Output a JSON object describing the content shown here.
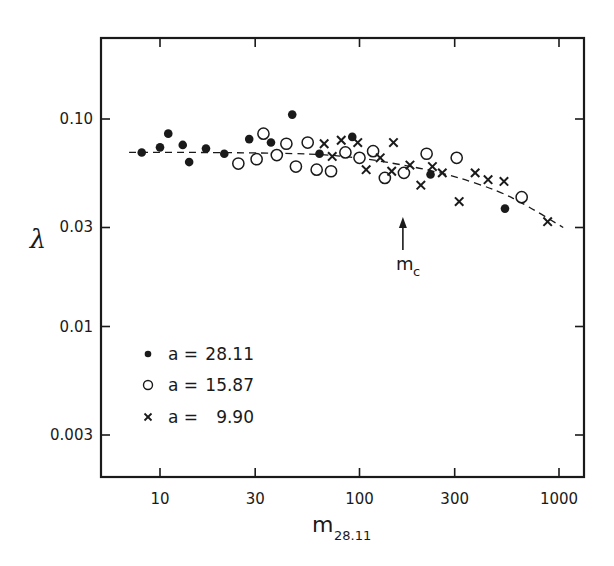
{
  "chart_data": {
    "type": "scatter",
    "title": "",
    "xlabel": "m",
    "xlabel_subscript": "28.11",
    "ylabel": "λ",
    "xscale": "log",
    "yscale": "log",
    "xlim": [
      6,
      1300
    ],
    "ylim": [
      0.0022,
      0.27
    ],
    "grid": false,
    "legend_position": "lower left (inside plot)",
    "x_ticks": [
      10,
      30,
      100,
      300,
      1000
    ],
    "x_tick_labels": [
      "10",
      "30",
      "100",
      "300",
      "1000"
    ],
    "y_ticks": [
      0.1,
      0.03,
      0.01,
      0.003
    ],
    "y_tick_labels": [
      "0.10",
      "0.03",
      "0.01",
      "0.003"
    ],
    "series": [
      {
        "name": "a = 28.11",
        "marker": "filled-circle",
        "legend_symbol": "•",
        "legend_a": "a =",
        "legend_value": "28.11",
        "points": [
          [
            8.1,
            0.069
          ],
          [
            10,
            0.073
          ],
          [
            11,
            0.085
          ],
          [
            13,
            0.075
          ],
          [
            14,
            0.062
          ],
          [
            17,
            0.072
          ],
          [
            21,
            0.068
          ],
          [
            28,
            0.08
          ],
          [
            36,
            0.077
          ],
          [
            46,
            0.105
          ],
          [
            63,
            0.068
          ],
          [
            92,
            0.082
          ],
          [
            227,
            0.054
          ],
          [
            536,
            0.037
          ]
        ]
      },
      {
        "name": "a = 15.87",
        "marker": "open-circle",
        "legend_symbol": "○",
        "legend_a": "a =",
        "legend_value": "15.87",
        "points": [
          [
            24.7,
            0.061
          ],
          [
            30.5,
            0.064
          ],
          [
            33,
            0.085
          ],
          [
            38.5,
            0.067
          ],
          [
            43,
            0.076
          ],
          [
            48,
            0.059
          ],
          [
            55,
            0.077
          ],
          [
            61,
            0.057
          ],
          [
            72,
            0.056
          ],
          [
            85,
            0.069
          ],
          [
            100,
            0.065
          ],
          [
            117,
            0.07
          ],
          [
            134,
            0.052
          ],
          [
            167,
            0.055
          ],
          [
            217,
            0.068
          ],
          [
            307,
            0.065
          ],
          [
            650,
            0.042
          ]
        ]
      },
      {
        "name": "a = 9.90",
        "marker": "cross",
        "legend_symbol": "×",
        "legend_a": "a =",
        "legend_value": "9.90",
        "points": [
          [
            66.5,
            0.076
          ],
          [
            73,
            0.066
          ],
          [
            81,
            0.079
          ],
          [
            98,
            0.077
          ],
          [
            108,
            0.057
          ],
          [
            127,
            0.065
          ],
          [
            145,
            0.056
          ],
          [
            148,
            0.077
          ],
          [
            179,
            0.06
          ],
          [
            203,
            0.048
          ],
          [
            232,
            0.059
          ],
          [
            260,
            0.055
          ],
          [
            316,
            0.04
          ],
          [
            380,
            0.055
          ],
          [
            441,
            0.051
          ],
          [
            530,
            0.05
          ],
          [
            877,
            0.032
          ]
        ]
      }
    ],
    "fit_curve": {
      "style": "dashed",
      "points": [
        [
          7,
          0.069
        ],
        [
          20,
          0.069
        ],
        [
          60,
          0.068
        ],
        [
          100,
          0.065
        ],
        [
          150,
          0.061
        ],
        [
          200,
          0.058
        ],
        [
          300,
          0.053
        ],
        [
          500,
          0.045
        ],
        [
          700,
          0.038
        ],
        [
          1050,
          0.03
        ]
      ]
    },
    "annotations": [
      {
        "text": "m",
        "subscript": "c",
        "arrow_x": 165,
        "arrow_tip_y": 0.044,
        "arrow_base_y": 0.03
      }
    ]
  }
}
